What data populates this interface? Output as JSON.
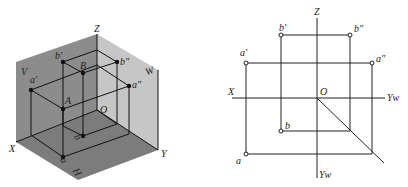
{
  "iso": {
    "labels": {
      "Z": "Z",
      "V": "V",
      "W": "W",
      "H": "H",
      "X": "X",
      "Y": "Y",
      "O": "O",
      "a1": "a'",
      "b1": "b'",
      "a2": "a\"",
      "b2": "b\"",
      "A": "A",
      "B": "B",
      "a": "a",
      "b": "b"
    },
    "colors": {
      "v_plane": "#8a8a8a",
      "w_plane": "#c4c4c4",
      "h_plane": "#7a7a7a",
      "line": "#111111"
    }
  },
  "ortho": {
    "labels": {
      "Z": "Z",
      "X": "X",
      "O": "O",
      "Yw_right": "Yw",
      "Yw_bottom": "Yw",
      "a1": "a'",
      "b1": "b'",
      "a2": "a\"",
      "b2": "b\"",
      "a": "a",
      "b": "b"
    },
    "colors": {
      "line": "#222222"
    }
  }
}
